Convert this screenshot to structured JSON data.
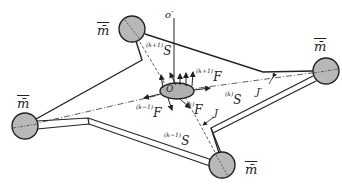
{
  "diagram": {
    "masses": [
      {
        "id": "top",
        "label": "m̄",
        "cx": 132,
        "cy": 29,
        "r": 13
      },
      {
        "id": "right",
        "label": "m̄",
        "cx": 326,
        "cy": 71,
        "r": 13
      },
      {
        "id": "left",
        "label": "m̄",
        "cx": 25,
        "cy": 126,
        "r": 13
      },
      {
        "id": "bottom",
        "label": "m̄",
        "cx": 222,
        "cy": 165,
        "r": 13
      }
    ],
    "center": {
      "label": "O",
      "cx": 177,
      "cy": 91
    },
    "axis_label": "o′",
    "labels": {
      "s_k_plus_1": {
        "sup": "(k+1)",
        "sym": "S"
      },
      "f_k_plus_1": {
        "sup": "(k+1)",
        "sym": "F"
      },
      "f_k_minus_1": {
        "sup": "(k−1)",
        "sym": "F"
      },
      "f_k": {
        "sup": "(k)",
        "sym": "F"
      },
      "s_k": {
        "sup": "(k)",
        "sym": "S"
      },
      "s_k_minus_1": {
        "sup": "(k−1)",
        "sym": "S"
      },
      "j": "J",
      "j_prime": "J′"
    },
    "colors": {
      "mass_fill": "#b8b8b8",
      "stroke": "#222222",
      "background": "#ffffff"
    }
  }
}
